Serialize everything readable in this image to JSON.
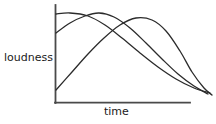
{
  "chart_data": {
    "type": "line",
    "title": "",
    "subtitle": "",
    "xlabel": "time",
    "ylabel": "loudness",
    "grid": false,
    "legend": false,
    "axes": {
      "x_ticks": [],
      "y_ticks": [],
      "xlim": [
        0,
        100
      ],
      "ylim": [
        0,
        100
      ],
      "origin_px": [
        55,
        103
      ],
      "x_axis_end_px": [
        190,
        103
      ],
      "y_axis_top_px": [
        55,
        5
      ]
    },
    "series": [
      {
        "name": "curve-1",
        "description": "fast attack, starts near maximum loudness and decays slowly",
        "points_px": [
          [
            56,
            14
          ],
          [
            70,
            13
          ],
          [
            88,
            16
          ],
          [
            105,
            25
          ],
          [
            122,
            38
          ],
          [
            140,
            53
          ],
          [
            158,
            67
          ],
          [
            176,
            79
          ],
          [
            194,
            88
          ],
          [
            210,
            93
          ]
        ],
        "x": [
          0,
          10,
          24,
          37,
          50,
          63,
          76,
          90,
          103,
          115
        ],
        "y": [
          90,
          91,
          88,
          79,
          65,
          51,
          36,
          24,
          15,
          10
        ]
      },
      {
        "name": "curve-2",
        "description": "medium attack, peaks mid-early then decays",
        "points_px": [
          [
            56,
            33
          ],
          [
            70,
            23
          ],
          [
            85,
            16
          ],
          [
            99,
            13
          ],
          [
            114,
            17
          ],
          [
            130,
            28
          ],
          [
            146,
            43
          ],
          [
            162,
            59
          ],
          [
            178,
            74
          ],
          [
            194,
            86
          ],
          [
            208,
            94
          ]
        ],
        "x": [
          0,
          10,
          21,
          32,
          43,
          55,
          67,
          79,
          91,
          103,
          113
        ],
        "y": [
          71,
          82,
          89,
          92,
          88,
          76,
          61,
          45,
          29,
          17,
          9
        ]
      },
      {
        "name": "curve-3",
        "description": "slow attack, starts low, peaks latest, then decays fastest",
        "points_px": [
          [
            56,
            90
          ],
          [
            72,
            72
          ],
          [
            88,
            54
          ],
          [
            104,
            38
          ],
          [
            120,
            25
          ],
          [
            136,
            18
          ],
          [
            152,
            20
          ],
          [
            166,
            31
          ],
          [
            180,
            51
          ],
          [
            192,
            72
          ],
          [
            204,
            88
          ],
          [
            212,
            95
          ]
        ],
        "x": [
          0,
          12,
          24,
          36,
          48,
          60,
          72,
          82,
          93,
          101,
          110,
          116
        ],
        "y": [
          13,
          31,
          49,
          65,
          78,
          85,
          83,
          72,
          52,
          31,
          15,
          8
        ]
      }
    ]
  },
  "style": {
    "background_color": "#ffffff",
    "line_color": "#2b2b2b",
    "axis_color": "#4a4a4a",
    "label_color": "#1a1a1a",
    "line_width_px": 1.3,
    "axis_width_px": 1.8
  },
  "icons": {
    "y_axis": "vertical-axis-line",
    "x_axis": "horizontal-axis-line"
  }
}
